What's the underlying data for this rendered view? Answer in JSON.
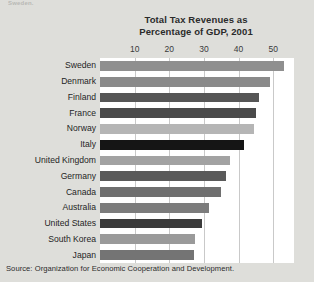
{
  "page": {
    "partial_top_text": "Sweden.",
    "background_color": "#dedeDA",
    "plot_background": "#ffffff"
  },
  "source": {
    "text": "Source: Organization for Economic Cooperation and Development."
  },
  "chart_data": {
    "type": "bar",
    "orientation": "horizontal",
    "title": "Total Tax Revenues as Percentage of GDP, 2001",
    "title_line1": "Total Tax Revenues as",
    "title_line2": "Percentage of GDP, 2001",
    "xlabel": "",
    "ylabel": "",
    "xlim": [
      0,
      56
    ],
    "ticks": [
      10,
      20,
      30,
      40,
      50
    ],
    "tick_labels": [
      "10",
      "20",
      "30",
      "40",
      "50"
    ],
    "grid": "vertical",
    "legend": "none",
    "categories": [
      "Sweden",
      "Denmark",
      "Finland",
      "France",
      "Norway",
      "Italy",
      "United Kingdom",
      "Germany",
      "Canada",
      "Australia",
      "United States",
      "South Korea",
      "Japan"
    ],
    "values": [
      53,
      49,
      46,
      45,
      44.5,
      41.5,
      37.5,
      36.5,
      35,
      31.5,
      29.5,
      27.5,
      27
    ],
    "bar_colors": [
      "#8f8f8f",
      "#8a8a8a",
      "#565656",
      "#4a4a4a",
      "#b5b5b5",
      "#151515",
      "#a2a2a2",
      "#5a5a5a",
      "#6f6f6f",
      "#7c7c7c",
      "#3b3b3b",
      "#9a9a9a",
      "#747474"
    ]
  }
}
